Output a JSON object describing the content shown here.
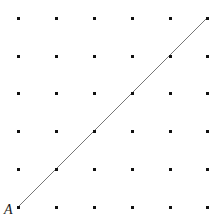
{
  "figure": {
    "width": 222,
    "height": 220,
    "background_color": "#ffffff"
  },
  "lattice": {
    "columns": 6,
    "rows": 6,
    "x_positions": [
      18,
      56,
      94,
      132,
      170,
      207
    ],
    "y_positions": [
      18,
      56,
      93,
      131,
      169,
      207
    ],
    "spacing_x": 37.8,
    "spacing_y": 37.8,
    "dot_size": 3,
    "dot_color": "#111111",
    "dot_shape": "square"
  },
  "segment": {
    "name": "diagonal-line",
    "start": {
      "x": 18,
      "y": 207
    },
    "end": {
      "x": 207,
      "y": 18
    },
    "color": "#777777",
    "width": 1,
    "passes_through": [
      {
        "x": 18,
        "y": 207
      },
      {
        "x": 56,
        "y": 169
      },
      {
        "x": 94,
        "y": 131
      },
      {
        "x": 132,
        "y": 93
      },
      {
        "x": 170,
        "y": 56
      },
      {
        "x": 207,
        "y": 18
      }
    ]
  },
  "labels": [
    {
      "id": "label-a",
      "text": "A",
      "x": 4,
      "y": 203,
      "anchor_point": {
        "x": 18,
        "y": 207
      },
      "color": "#1a1a1a",
      "style": "italic"
    }
  ]
}
